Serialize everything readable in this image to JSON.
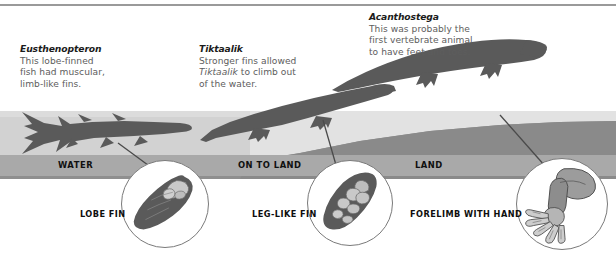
{
  "figure": {
    "domain": "evolution-diagram",
    "title_visible": false
  },
  "captions": [
    {
      "id": "eusthenopteron",
      "heading": "Eusthenopteron",
      "lines": [
        "This lobe-finned",
        "fish had muscular,",
        "limb-like fins."
      ]
    },
    {
      "id": "tiktaalik",
      "heading": "Tiktaalik",
      "lines": [
        "Stronger fins allowed",
        "Tiktaalik to climb out",
        "of the water."
      ],
      "italic_word": "Tiktaalik"
    },
    {
      "id": "acanthostega",
      "heading": "Acanthostega",
      "lines": [
        "This was probably the",
        "first vertebrate animal",
        "to have feet and toes."
      ]
    }
  ],
  "zones": [
    {
      "id": "water",
      "label": "WATER"
    },
    {
      "id": "on-to-land",
      "label": "ON TO LAND"
    },
    {
      "id": "land",
      "label": "LAND"
    }
  ],
  "callouts": [
    {
      "id": "lobe-fin",
      "label": "LOBE FIN"
    },
    {
      "id": "leg-like-fin",
      "label": "LEG-LIKE FIN"
    },
    {
      "id": "forelimb-with-hand",
      "label": "FORELIMB WITH HAND"
    }
  ],
  "organisms": [
    {
      "id": "eusthenopteron",
      "name": "Eusthenopteron",
      "habitat": "water"
    },
    {
      "id": "tiktaalik",
      "name": "Tiktaalik",
      "habitat": "on-to-land"
    },
    {
      "id": "acanthostega",
      "name": "Acanthostega",
      "habitat": "land"
    }
  ],
  "colors": {
    "silhouette": "#5a5a5a",
    "ground": "#8f8f8f",
    "water": "#d2d2d2",
    "sky": "#e2e2e2",
    "strip": "#a9a9a9",
    "bone_light": "#c9c9c9",
    "bone_mid": "#9f9f9f",
    "circle_border": "#7a7a7a",
    "heading_text": "#1b1b1b",
    "body_text": "#5d5d5d",
    "label_text": "#101010"
  }
}
